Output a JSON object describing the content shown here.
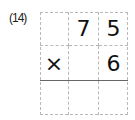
{
  "problem": {
    "number_label": "(14)",
    "operation": "multiplication",
    "grid": {
      "rows": [
        [
          "",
          "7",
          "5"
        ],
        [
          "×",
          "",
          "6"
        ],
        [
          "",
          "",
          ""
        ]
      ]
    },
    "multiplicand": "75",
    "multiplier": "6",
    "answer_row_filled": false
  }
}
